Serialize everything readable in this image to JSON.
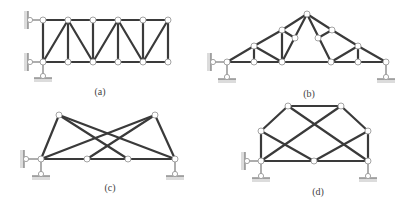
{
  "figure": {
    "panels": [
      {
        "id": "a",
        "caption": "(a)",
        "caption_pos": [
          100,
          86
        ],
        "nodes": [
          [
            43,
            20
          ],
          [
            68,
            20
          ],
          [
            93,
            20
          ],
          [
            118,
            20
          ],
          [
            143,
            20
          ],
          [
            168,
            20
          ],
          [
            43,
            62
          ],
          [
            68,
            62
          ],
          [
            93,
            62
          ],
          [
            118,
            62
          ],
          [
            143,
            62
          ],
          [
            168,
            62
          ]
        ],
        "members": [
          [
            43,
            20,
            168,
            20
          ],
          [
            43,
            62,
            168,
            62
          ],
          [
            43,
            20,
            43,
            62
          ],
          [
            68,
            20,
            68,
            62
          ],
          [
            93,
            20,
            93,
            62
          ],
          [
            118,
            20,
            118,
            62
          ],
          [
            143,
            20,
            143,
            62
          ],
          [
            168,
            20,
            168,
            62
          ],
          [
            43,
            62,
            68,
            20
          ],
          [
            68,
            20,
            93,
            62
          ],
          [
            93,
            62,
            118,
            20
          ],
          [
            118,
            20,
            143,
            62
          ],
          [
            143,
            62,
            168,
            20
          ]
        ],
        "supports": [
          {
            "type": "wall-pin",
            "node": [
              43,
              20
            ],
            "pin": [
              30,
              20
            ]
          },
          {
            "type": "wall-pin",
            "node": [
              43,
              62
            ],
            "pin": [
              30,
              62
            ]
          },
          {
            "type": "ground-link",
            "node": [
              43,
              62
            ],
            "pin": [
              43,
              76
            ]
          }
        ]
      },
      {
        "id": "b",
        "caption": "(b)",
        "caption_pos": [
          309,
          88
        ],
        "nodes": [
          [
            227,
            62
          ],
          [
            254,
            62
          ],
          [
            282,
            62
          ],
          [
            331,
            62
          ],
          [
            358,
            62
          ],
          [
            386,
            62
          ],
          [
            254,
            46
          ],
          [
            282,
            30
          ],
          [
            307,
            14
          ],
          [
            332,
            30
          ],
          [
            358,
            46
          ],
          [
            295,
            38
          ],
          [
            318,
            38
          ]
        ],
        "members": [
          [
            227,
            62,
            386,
            62
          ],
          [
            227,
            62,
            254,
            46
          ],
          [
            254,
            46,
            282,
            30
          ],
          [
            282,
            30,
            307,
            14
          ],
          [
            307,
            14,
            332,
            30
          ],
          [
            332,
            30,
            358,
            46
          ],
          [
            358,
            46,
            386,
            62
          ],
          [
            254,
            46,
            254,
            62
          ],
          [
            282,
            30,
            282,
            62
          ],
          [
            358,
            46,
            358,
            62
          ],
          [
            254,
            46,
            282,
            62
          ],
          [
            282,
            30,
            295,
            38
          ],
          [
            307,
            14,
            282,
            62
          ],
          [
            358,
            46,
            331,
            62
          ],
          [
            332,
            30,
            318,
            38
          ],
          [
            307,
            14,
            331,
            62
          ]
        ],
        "supports": [
          {
            "type": "wall-pin",
            "node": [
              227,
              62
            ],
            "pin": [
              213,
              62
            ]
          },
          {
            "type": "ground-link",
            "node": [
              227,
              62
            ],
            "pin": [
              227,
              77
            ]
          },
          {
            "type": "ground-link",
            "node": [
              386,
              62
            ],
            "pin": [
              386,
              77
            ]
          }
        ]
      },
      {
        "id": "c",
        "caption": "(c)",
        "caption_pos": [
          110,
          182
        ],
        "nodes": [
          [
            59,
            115
          ],
          [
            155,
            115
          ],
          [
            41,
            159
          ],
          [
            87,
            159
          ],
          [
            128,
            159
          ],
          [
            175,
            159
          ]
        ],
        "members": [
          [
            41,
            159,
            175,
            159
          ],
          [
            41,
            159,
            59,
            115
          ],
          [
            59,
            115,
            128,
            159
          ],
          [
            59,
            115,
            175,
            159
          ],
          [
            155,
            115,
            41,
            159
          ],
          [
            155,
            115,
            87,
            159
          ],
          [
            155,
            115,
            175,
            159
          ]
        ],
        "supports": [
          {
            "type": "wall-pin",
            "node": [
              41,
              159
            ],
            "pin": [
              26,
              159
            ]
          },
          {
            "type": "ground-link",
            "node": [
              41,
              159
            ],
            "pin": [
              41,
              174
            ]
          },
          {
            "type": "ground-link",
            "node": [
              175,
              159
            ],
            "pin": [
              175,
              174
            ]
          }
        ]
      },
      {
        "id": "d",
        "caption": "(d)",
        "caption_pos": [
          318,
          186
        ],
        "nodes": [
          [
            288,
            106
          ],
          [
            341,
            106
          ],
          [
            261,
            131
          ],
          [
            368,
            131
          ],
          [
            261,
            161
          ],
          [
            314,
            161
          ],
          [
            368,
            161
          ]
        ],
        "members": [
          [
            261,
            131,
            288,
            106
          ],
          [
            288,
            106,
            341,
            106
          ],
          [
            341,
            106,
            368,
            131
          ],
          [
            261,
            131,
            261,
            161
          ],
          [
            368,
            131,
            368,
            161
          ],
          [
            261,
            161,
            368,
            161
          ],
          [
            288,
            106,
            368,
            161
          ],
          [
            341,
            106,
            261,
            161
          ],
          [
            261,
            131,
            314,
            161
          ],
          [
            368,
            131,
            314,
            161
          ]
        ],
        "supports": [
          {
            "type": "wall-pin",
            "node": [
              261,
              161
            ],
            "pin": [
              247,
              161
            ]
          },
          {
            "type": "ground-link",
            "node": [
              261,
              161
            ],
            "pin": [
              261,
              176
            ]
          },
          {
            "type": "ground-link",
            "node": [
              368,
              161
            ],
            "pin": [
              368,
              176
            ]
          }
        ]
      }
    ]
  }
}
